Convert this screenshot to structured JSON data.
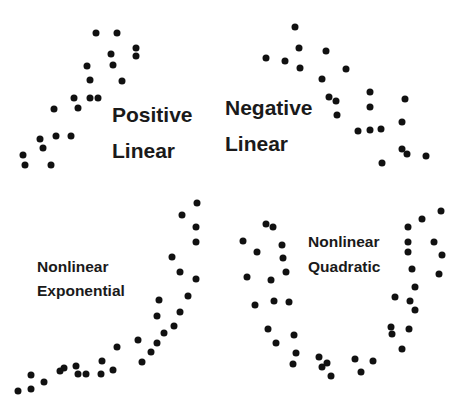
{
  "chart_data": [
    {
      "type": "scatter",
      "title": "Positive Linear",
      "label_lines": [
        "Positive",
        "Linear"
      ],
      "label_pos": {
        "x": 112,
        "y1": 122,
        "y2": 158
      },
      "label_size": "lg",
      "points": [
        [
          96,
          33
        ],
        [
          117,
          33
        ],
        [
          136,
          48
        ],
        [
          136,
          56
        ],
        [
          111,
          54
        ],
        [
          113,
          65
        ],
        [
          87,
          66
        ],
        [
          90,
          80
        ],
        [
          122,
          81
        ],
        [
          74,
          98
        ],
        [
          90,
          98
        ],
        [
          98,
          98
        ],
        [
          54,
          109
        ],
        [
          78,
          108
        ],
        [
          56,
          136
        ],
        [
          71,
          136
        ],
        [
          40,
          139
        ],
        [
          43,
          148
        ],
        [
          23,
          155
        ],
        [
          25,
          165
        ],
        [
          51,
          165
        ]
      ]
    },
    {
      "type": "scatter",
      "title": "Negative Linear",
      "label_lines": [
        "Negative",
        "Linear"
      ],
      "label_pos": {
        "x": 225,
        "y1": 115,
        "y2": 151
      },
      "label_size": "lg",
      "points": [
        [
          295,
          27
        ],
        [
          299,
          48
        ],
        [
          326,
          51
        ],
        [
          266,
          58
        ],
        [
          285,
          61
        ],
        [
          300,
          68
        ],
        [
          346,
          69
        ],
        [
          322,
          79
        ],
        [
          329,
          97
        ],
        [
          336,
          101
        ],
        [
          370,
          92
        ],
        [
          370,
          107
        ],
        [
          337,
          115
        ],
        [
          405,
          99
        ],
        [
          402,
          122
        ],
        [
          358,
          131
        ],
        [
          370,
          130
        ],
        [
          381,
          129
        ],
        [
          402,
          149
        ],
        [
          407,
          154
        ],
        [
          426,
          156
        ],
        [
          382,
          163
        ]
      ]
    },
    {
      "type": "scatter",
      "title": "Nonlinear Exponential",
      "label_lines": [
        "Nonlinear",
        "Exponential"
      ],
      "label_pos": {
        "x": 37,
        "y1": 272,
        "y2": 296
      },
      "label_size": "sm",
      "points": [
        [
          197,
          203
        ],
        [
          182,
          215
        ],
        [
          196,
          227
        ],
        [
          196,
          242
        ],
        [
          172,
          257
        ],
        [
          180,
          272
        ],
        [
          196,
          279
        ],
        [
          188,
          296
        ],
        [
          159,
          300
        ],
        [
          157,
          316
        ],
        [
          180,
          312
        ],
        [
          174,
          326
        ],
        [
          164,
          333
        ],
        [
          138,
          340
        ],
        [
          157,
          343
        ],
        [
          151,
          352
        ],
        [
          142,
          362
        ],
        [
          117,
          347
        ],
        [
          102,
          361
        ],
        [
          113,
          370
        ],
        [
          101,
          374
        ],
        [
          86,
          374
        ],
        [
          78,
          374
        ],
        [
          76,
          366
        ],
        [
          64,
          368
        ],
        [
          60,
          371
        ],
        [
          44,
          382
        ],
        [
          31,
          375
        ],
        [
          31,
          389
        ],
        [
          18,
          391
        ]
      ]
    },
    {
      "type": "scatter",
      "title": "Nonlinear Quadratic",
      "label_lines": [
        "Nonlinear",
        "Quadratic"
      ],
      "label_pos": {
        "x": 308,
        "y1": 247,
        "y2": 272
      },
      "label_size": "sm",
      "points": [
        [
          266,
          224
        ],
        [
          273,
          227
        ],
        [
          243,
          241
        ],
        [
          257,
          252
        ],
        [
          282,
          245
        ],
        [
          283,
          258
        ],
        [
          247,
          277
        ],
        [
          286,
          272
        ],
        [
          271,
          280
        ],
        [
          255,
          305
        ],
        [
          274,
          301
        ],
        [
          289,
          302
        ],
        [
          268,
          329
        ],
        [
          276,
          343
        ],
        [
          294,
          335
        ],
        [
          296,
          353
        ],
        [
          293,
          364
        ],
        [
          319,
          357
        ],
        [
          322,
          367
        ],
        [
          327,
          363
        ],
        [
          331,
          376
        ],
        [
          355,
          359
        ],
        [
          361,
          372
        ],
        [
          373,
          361
        ],
        [
          402,
          349
        ],
        [
          391,
          327
        ],
        [
          392,
          334
        ],
        [
          409,
          329
        ],
        [
          395,
          297
        ],
        [
          410,
          301
        ],
        [
          415,
          310
        ],
        [
          415,
          287
        ],
        [
          412,
          269
        ],
        [
          439,
          274
        ],
        [
          408,
          252
        ],
        [
          442,
          255
        ],
        [
          408,
          242
        ],
        [
          434,
          242
        ],
        [
          408,
          227
        ],
        [
          422,
          219
        ],
        [
          441,
          211
        ]
      ]
    }
  ],
  "style": {
    "dot_color": "#111111",
    "dot_radius": 3.5,
    "background": "#ffffff",
    "label_color": "#1a1a1a"
  },
  "labels": {
    "positive_linear": [
      "Positive",
      "Linear"
    ],
    "negative_linear": [
      "Negative",
      "Linear"
    ],
    "nonlinear_exponential": [
      "Nonlinear",
      "Exponential"
    ],
    "nonlinear_quadratic": [
      "Nonlinear",
      "Quadratic"
    ]
  }
}
